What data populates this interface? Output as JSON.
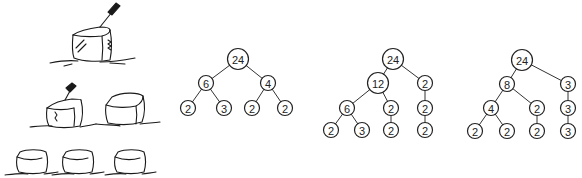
{
  "illustration": {
    "description": "Sketch of ice cubes being split with a knife: one large cube, then two cubes, then three cubes",
    "rows": [
      {
        "cubes": 1,
        "has_knife": true
      },
      {
        "cubes": 2,
        "has_knife": true
      },
      {
        "cubes": 3,
        "has_knife": false
      }
    ]
  },
  "trees": [
    {
      "name": "factor-tree-1",
      "nodes": [
        {
          "id": "a",
          "label": "24",
          "x": 238,
          "y": 59
        },
        {
          "id": "b",
          "label": "6",
          "x": 206,
          "y": 83
        },
        {
          "id": "c",
          "label": "4",
          "x": 268,
          "y": 83
        },
        {
          "id": "d",
          "label": "2",
          "x": 188,
          "y": 108
        },
        {
          "id": "e",
          "label": "3",
          "x": 224,
          "y": 108
        },
        {
          "id": "f",
          "label": "2",
          "x": 252,
          "y": 108
        },
        {
          "id": "g",
          "label": "2",
          "x": 285,
          "y": 108
        }
      ],
      "edges": [
        [
          "a",
          "b"
        ],
        [
          "a",
          "c"
        ],
        [
          "b",
          "d"
        ],
        [
          "b",
          "e"
        ],
        [
          "c",
          "f"
        ],
        [
          "c",
          "g"
        ]
      ]
    },
    {
      "name": "factor-tree-2",
      "nodes": [
        {
          "id": "a",
          "label": "24",
          "x": 393,
          "y": 59
        },
        {
          "id": "b",
          "label": "12",
          "x": 378,
          "y": 83
        },
        {
          "id": "c",
          "label": "2",
          "x": 425,
          "y": 83
        },
        {
          "id": "d",
          "label": "6",
          "x": 347,
          "y": 108
        },
        {
          "id": "e",
          "label": "2",
          "x": 391,
          "y": 108
        },
        {
          "id": "f",
          "label": "2",
          "x": 425,
          "y": 108
        },
        {
          "id": "g",
          "label": "2",
          "x": 331,
          "y": 130
        },
        {
          "id": "h",
          "label": "3",
          "x": 362,
          "y": 130
        },
        {
          "id": "i",
          "label": "2",
          "x": 391,
          "y": 130
        },
        {
          "id": "j",
          "label": "2",
          "x": 425,
          "y": 130
        }
      ],
      "edges": [
        [
          "a",
          "b"
        ],
        [
          "a",
          "c"
        ],
        [
          "b",
          "d"
        ],
        [
          "b",
          "e"
        ],
        [
          "c",
          "f"
        ],
        [
          "d",
          "g"
        ],
        [
          "d",
          "h"
        ],
        [
          "e",
          "i"
        ],
        [
          "f",
          "j"
        ]
      ]
    },
    {
      "name": "factor-tree-3",
      "nodes": [
        {
          "id": "a",
          "label": "24",
          "x": 522,
          "y": 60
        },
        {
          "id": "b",
          "label": "8",
          "x": 507,
          "y": 84
        },
        {
          "id": "c",
          "label": "3",
          "x": 568,
          "y": 84
        },
        {
          "id": "d",
          "label": "4",
          "x": 491,
          "y": 108
        },
        {
          "id": "e",
          "label": "2",
          "x": 537,
          "y": 108
        },
        {
          "id": "f",
          "label": "3",
          "x": 568,
          "y": 108
        },
        {
          "id": "g",
          "label": "2",
          "x": 475,
          "y": 131
        },
        {
          "id": "h",
          "label": "2",
          "x": 507,
          "y": 131
        },
        {
          "id": "i",
          "label": "2",
          "x": 537,
          "y": 131
        },
        {
          "id": "j",
          "label": "3",
          "x": 568,
          "y": 131
        }
      ],
      "edges": [
        [
          "a",
          "b"
        ],
        [
          "a",
          "c"
        ],
        [
          "b",
          "d"
        ],
        [
          "b",
          "e"
        ],
        [
          "c",
          "f"
        ],
        [
          "d",
          "g"
        ],
        [
          "d",
          "h"
        ],
        [
          "e",
          "i"
        ],
        [
          "f",
          "j"
        ]
      ]
    }
  ]
}
